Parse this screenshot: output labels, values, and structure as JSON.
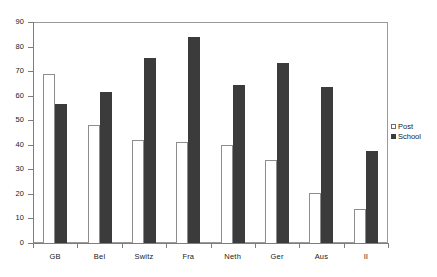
{
  "chart_data": {
    "type": "bar",
    "title": "",
    "subtitle": "",
    "xlabel": "",
    "ylabel": "",
    "ylim": [
      0,
      90
    ],
    "ytick_step": 10,
    "yticks": [
      0,
      10,
      20,
      30,
      40,
      50,
      60,
      70,
      80,
      90
    ],
    "grid": false,
    "legend_position": "right",
    "categories": [
      "GB",
      "Bel",
      "Switz",
      "Fra",
      "Neth",
      "Ger",
      "Aus",
      "Il"
    ],
    "series": [
      {
        "name": "Post",
        "color": "#ffffff",
        "edge_color": "#8d8d8d",
        "values": [
          69,
          48,
          42,
          41,
          40,
          34,
          20.5,
          14
        ]
      },
      {
        "name": "School",
        "color": "#3b3b3b",
        "edge_color": "#3b3b3b",
        "values": [
          56.5,
          61.5,
          75.5,
          84,
          64.5,
          73.5,
          63.5,
          37.5
        ]
      }
    ]
  },
  "legend": {
    "items": [
      {
        "label": "Post",
        "swatch": "open-square-icon"
      },
      {
        "label": "School",
        "swatch": "filled-square-icon"
      }
    ]
  },
  "axis": {
    "y_labels": [
      "90",
      "80",
      "70",
      "60",
      "50",
      "40",
      "30",
      "20",
      "10",
      "0"
    ],
    "x_labels": [
      "GB",
      "Bel",
      "Switz",
      "Fra",
      "Neth",
      "Ger",
      "Aus",
      "Il"
    ]
  },
  "colors": {
    "series_post": "#ffffff",
    "series_school": "#3b3b3b",
    "axis": "#7d7d7d",
    "frame": "#9a9a9a",
    "text": "#1a1a1a",
    "background": "#ffffff"
  }
}
